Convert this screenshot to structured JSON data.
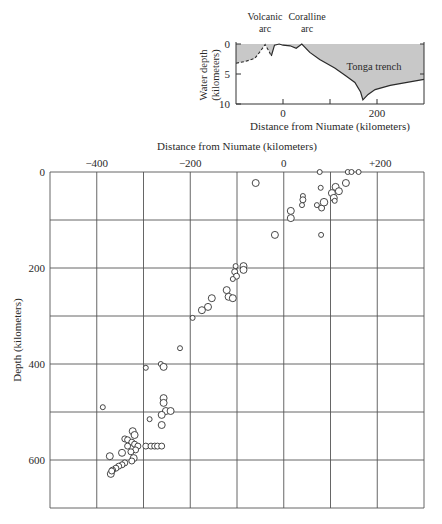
{
  "profile": {
    "ylabel_line1": "Water depth",
    "ylabel_line2": "(kilometers)",
    "xlabel": "Distance from Niumate (kilometers)",
    "annotations": [
      {
        "line1": "Volcanic",
        "line2": "arc",
        "x": -30
      },
      {
        "line1": "Coralline",
        "line2": "arc",
        "x": 40
      },
      {
        "text": "Tonga trench",
        "x": 195,
        "depth": 3.3
      }
    ],
    "yticks": [
      0,
      5,
      10
    ],
    "xticks": [
      0,
      200
    ],
    "minor_xticks": [
      100
    ],
    "xrange": [
      -100,
      300
    ],
    "yrange": [
      0,
      10
    ],
    "fill_color": "#c8c8c8"
  },
  "chart_data": [
    {
      "type": "line",
      "title": "Seafloor profile across the Tonga arc and trench",
      "xlabel": "Distance from Niumate (kilometers)",
      "ylabel": "Water depth (kilometers)",
      "xlim": [
        -100,
        300
      ],
      "ylim": [
        10,
        0
      ],
      "x": [
        -100,
        -80,
        -60,
        -50,
        -38,
        -30,
        -25,
        -18,
        -8,
        0,
        15,
        28,
        40,
        57,
        78,
        110,
        132,
        153,
        165,
        170,
        181,
        196,
        228,
        270,
        300
      ],
      "y": [
        3.2,
        2.9,
        2.4,
        1.4,
        0.1,
        1.2,
        2.0,
        0.2,
        0.0,
        0.2,
        0.3,
        0.7,
        0.0,
        1.4,
        2.6,
        4.0,
        5.2,
        6.4,
        8.0,
        9.3,
        8.4,
        7.6,
        6.9,
        6.3,
        5.9
      ],
      "dashed_range": [
        -100,
        -20
      ],
      "annotations": [
        "Volcanic arc",
        "Coralline arc",
        "Tonga trench"
      ]
    },
    {
      "type": "scatter",
      "title": "Earthquake foci beneath the Tonga arc",
      "xlabel": "Distance from Niumate (kilometers)",
      "ylabel": "Depth (kilometers)",
      "xlim": [
        -500,
        300
      ],
      "ylim": [
        700,
        0
      ],
      "xticks": [
        -400,
        -200,
        0,
        200
      ],
      "xtick_labels": [
        "−400",
        "−200",
        "0",
        "+200"
      ],
      "yticks": [
        0,
        200,
        400,
        600
      ],
      "grid": true,
      "grid_step_x": 100,
      "grid_step_y": 100,
      "points": [
        {
          "x": -60,
          "y": 23,
          "r": 3.5
        },
        {
          "x": 77,
          "y": 0,
          "r": 2.5
        },
        {
          "x": 137,
          "y": 0,
          "r": 2.5
        },
        {
          "x": 145,
          "y": 0,
          "r": 2.5
        },
        {
          "x": 160,
          "y": 0,
          "r": 2.5
        },
        {
          "x": 79,
          "y": 33,
          "r": 2.5
        },
        {
          "x": 111,
          "y": 31,
          "r": 3.5
        },
        {
          "x": 133,
          "y": 23,
          "r": 3.5
        },
        {
          "x": 103,
          "y": 44,
          "r": 3.5
        },
        {
          "x": 118,
          "y": 40,
          "r": 3.5
        },
        {
          "x": 107,
          "y": 54,
          "r": 3.5
        },
        {
          "x": 109,
          "y": 60,
          "r": 2.5
        },
        {
          "x": 71,
          "y": 69,
          "r": 2.5
        },
        {
          "x": 81,
          "y": 75,
          "r": 3
        },
        {
          "x": 86,
          "y": 63,
          "r": 3.8
        },
        {
          "x": 80,
          "y": 131,
          "r": 2.5
        },
        {
          "x": 41,
          "y": 50,
          "r": 2.5
        },
        {
          "x": 41,
          "y": 58,
          "r": 3
        },
        {
          "x": 39,
          "y": 69,
          "r": 2.5
        },
        {
          "x": 15,
          "y": 81,
          "r": 3.5
        },
        {
          "x": 15,
          "y": 96,
          "r": 3.5
        },
        {
          "x": -19,
          "y": 131,
          "r": 3.5
        },
        {
          "x": -103,
          "y": 196,
          "r": 2.5
        },
        {
          "x": -86,
          "y": 196,
          "r": 3.5
        },
        {
          "x": -86,
          "y": 204,
          "r": 3.5
        },
        {
          "x": -105,
          "y": 208,
          "r": 3
        },
        {
          "x": -101,
          "y": 217,
          "r": 3
        },
        {
          "x": -109,
          "y": 223,
          "r": 2.5
        },
        {
          "x": -122,
          "y": 246,
          "r": 3.5
        },
        {
          "x": -118,
          "y": 260,
          "r": 3.5
        },
        {
          "x": -109,
          "y": 263,
          "r": 3.5
        },
        {
          "x": -154,
          "y": 263,
          "r": 3.5
        },
        {
          "x": -162,
          "y": 281,
          "r": 3.5
        },
        {
          "x": -175,
          "y": 288,
          "r": 3.5
        },
        {
          "x": -195,
          "y": 304,
          "r": 2.5
        },
        {
          "x": -222,
          "y": 367,
          "r": 2.5
        },
        {
          "x": -295,
          "y": 408,
          "r": 2.5
        },
        {
          "x": -263,
          "y": 400,
          "r": 2.5
        },
        {
          "x": -257,
          "y": 406,
          "r": 3.5
        },
        {
          "x": -257,
          "y": 471,
          "r": 3.5
        },
        {
          "x": -257,
          "y": 481,
          "r": 3.5
        },
        {
          "x": -252,
          "y": 498,
          "r": 3.5
        },
        {
          "x": -242,
          "y": 498,
          "r": 3.5
        },
        {
          "x": -261,
          "y": 506,
          "r": 3.5
        },
        {
          "x": -287,
          "y": 515,
          "r": 2.5
        },
        {
          "x": -261,
          "y": 527,
          "r": 3.5
        },
        {
          "x": -387,
          "y": 490,
          "r": 2.5
        },
        {
          "x": -323,
          "y": 540,
          "r": 3.5
        },
        {
          "x": -319,
          "y": 548,
          "r": 3.5
        },
        {
          "x": -340,
          "y": 556,
          "r": 3
        },
        {
          "x": -334,
          "y": 558,
          "r": 3
        },
        {
          "x": -325,
          "y": 563,
          "r": 3
        },
        {
          "x": -319,
          "y": 567,
          "r": 3
        },
        {
          "x": -334,
          "y": 571,
          "r": 3
        },
        {
          "x": -312,
          "y": 571,
          "r": 3
        },
        {
          "x": -295,
          "y": 571,
          "r": 3
        },
        {
          "x": -284,
          "y": 571,
          "r": 3
        },
        {
          "x": -276,
          "y": 571,
          "r": 3
        },
        {
          "x": -270,
          "y": 571,
          "r": 3
        },
        {
          "x": -261,
          "y": 571,
          "r": 3
        },
        {
          "x": -317,
          "y": 579,
          "r": 3
        },
        {
          "x": -327,
          "y": 583,
          "r": 3
        },
        {
          "x": -346,
          "y": 585,
          "r": 3.5
        },
        {
          "x": -372,
          "y": 592,
          "r": 3.5
        },
        {
          "x": -321,
          "y": 596,
          "r": 3.5
        },
        {
          "x": -325,
          "y": 602,
          "r": 3
        },
        {
          "x": -340,
          "y": 606,
          "r": 3
        },
        {
          "x": -346,
          "y": 610,
          "r": 3
        },
        {
          "x": -353,
          "y": 613,
          "r": 3
        },
        {
          "x": -359,
          "y": 617,
          "r": 3
        },
        {
          "x": -366,
          "y": 621,
          "r": 3
        },
        {
          "x": -370,
          "y": 629,
          "r": 3.5
        },
        {
          "x": -368,
          "y": 623,
          "r": 3
        }
      ]
    }
  ],
  "main": {
    "title": "Distance from Niumate (kilometers)",
    "ylabel": "Depth (kilometers)",
    "xtick_labels": [
      "−400",
      "−200",
      "0",
      "+200"
    ],
    "xtick_values": [
      -400,
      -200,
      0,
      200
    ],
    "ytick_labels": [
      "0",
      "200",
      "400",
      "600"
    ],
    "ytick_values": [
      0,
      200,
      400,
      600
    ],
    "grid_color": "#555555",
    "marker_stroke": "#333333"
  }
}
